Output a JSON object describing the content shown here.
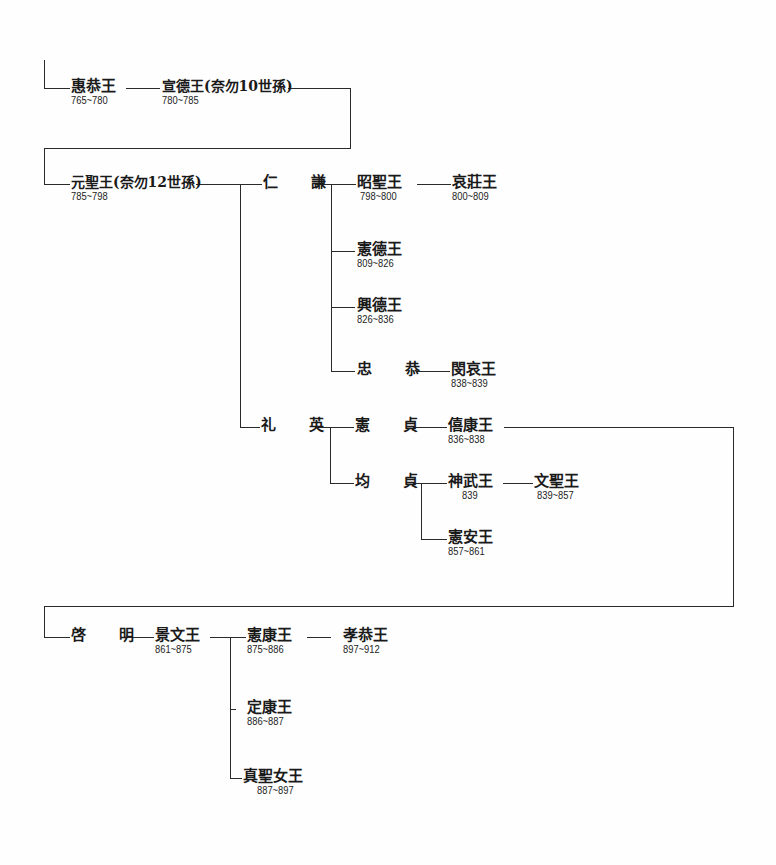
{
  "diagram": {
    "title": "",
    "type": "genealogy-tree",
    "nodes": {
      "hyegong": {
        "name": "惠恭王",
        "years": "765~780"
      },
      "seondeok": {
        "name": "宣德王(奈勿10世孫)",
        "years": "780~785"
      },
      "wonseong": {
        "name": "元聖王(奈勿12世孫)",
        "years": "785~798"
      },
      "ingyeom": {
        "name": "仁 謙",
        "years": ""
      },
      "soseong": {
        "name": "昭聖王",
        "years": "798~800"
      },
      "aejang": {
        "name": "哀莊王",
        "years": "800~809"
      },
      "heondeok": {
        "name": "憲德王",
        "years": "809~826"
      },
      "heungdeok": {
        "name": "興德王",
        "years": "826~836"
      },
      "chunggong": {
        "name": "忠 恭",
        "years": ""
      },
      "minae": {
        "name": "閔哀王",
        "years": "838~839"
      },
      "yeyeong": {
        "name": "礼 英",
        "years": ""
      },
      "heonjeong": {
        "name": "憲 貞",
        "years": ""
      },
      "huigang": {
        "name": "僖康王",
        "years": "836~838"
      },
      "gyunjeong": {
        "name": "均 貞",
        "years": ""
      },
      "sinmu": {
        "name": "神武王",
        "years": "839"
      },
      "munseong": {
        "name": "文聖王",
        "years": "839~857"
      },
      "heonan": {
        "name": "憲安王",
        "years": "857~861"
      },
      "gyemyeong": {
        "name": "啓 明",
        "years": ""
      },
      "gyeongmun": {
        "name": "景文王",
        "years": "861~875"
      },
      "heongang": {
        "name": "憲康王",
        "years": "875~886"
      },
      "hyogong": {
        "name": "孝恭王",
        "years": "897~912"
      },
      "jeonggang": {
        "name": "定康王",
        "years": "886~887"
      },
      "jinseong": {
        "name": "真聖女王",
        "years": "887~897"
      }
    }
  }
}
